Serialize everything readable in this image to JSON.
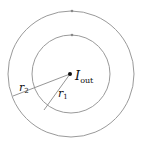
{
  "diagram": {
    "center_label": {
      "main": "I",
      "subscript": "out"
    },
    "radius_labels": [
      {
        "main": "r",
        "subscript": "1"
      },
      {
        "main": "r",
        "subscript": "2"
      }
    ],
    "colors": {
      "circle_stroke": "#9a9a9a",
      "line_stroke": "#8a8a8a",
      "dot": "#111111",
      "text": "#111111"
    }
  }
}
